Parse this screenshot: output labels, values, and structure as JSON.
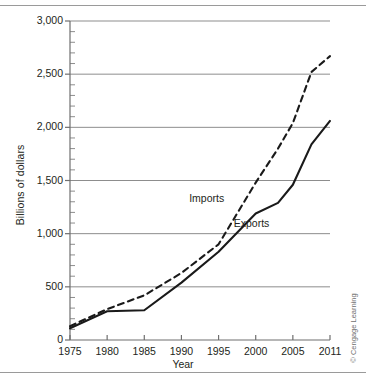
{
  "figure": {
    "credit": "© Cengage Learning",
    "top_rule": "horizontal-rule",
    "bottom_rule": "horizontal-rule"
  },
  "chart_data": {
    "type": "line",
    "title": "",
    "xlabel": "Year",
    "ylabel": "Billions of dollars",
    "xlim": [
      1975,
      2011
    ],
    "ylim": [
      0,
      3000
    ],
    "grid": true,
    "legend_position": "inline-annotations",
    "x_ticks": [
      1975,
      1980,
      1985,
      1990,
      1995,
      2000,
      2005,
      2011
    ],
    "x_tick_labels": [
      "1975",
      "1980",
      "1985",
      "1990",
      "1995",
      "2000",
      "2005",
      "2011"
    ],
    "y_ticks": [
      0,
      500,
      1000,
      1500,
      2000,
      2500,
      3000
    ],
    "y_tick_labels": [
      "0",
      "500",
      "1,000",
      "1,500",
      "2,000",
      "2,500",
      "3,000"
    ],
    "y_minor_step": 100,
    "annotations": [
      {
        "text": "Imports",
        "x": 1994.0,
        "y": 1330
      },
      {
        "text": "Exports",
        "x": 2000.0,
        "y": 1090
      }
    ],
    "series": [
      {
        "name": "Imports",
        "style": "dashed",
        "color": "#1a1a1a",
        "x": [
          1975,
          1980,
          1985,
          1990,
          1995,
          2000,
          2003,
          2005,
          2008,
          2011
        ],
        "values": [
          130,
          290,
          420,
          630,
          900,
          1480,
          1800,
          2040,
          2520,
          2670
        ]
      },
      {
        "name": "Exports",
        "style": "solid",
        "color": "#1a1a1a",
        "x": [
          1975,
          1980,
          1985,
          1990,
          1995,
          2000,
          2003,
          2005,
          2008,
          2011
        ],
        "values": [
          110,
          270,
          280,
          540,
          830,
          1190,
          1290,
          1460,
          1840,
          2060
        ]
      }
    ]
  }
}
